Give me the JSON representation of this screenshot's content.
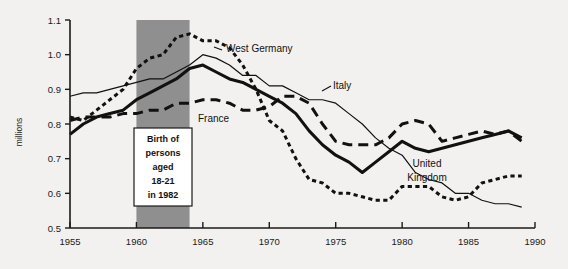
{
  "chart_data": {
    "type": "line",
    "title": "",
    "xlabel": "",
    "ylabel": "millions",
    "xlim": [
      1955,
      1990
    ],
    "ylim": [
      0.5,
      1.1
    ],
    "grid": false,
    "legend_position": "inline-annotations",
    "x_ticks": [
      "1955",
      "1960",
      "1965",
      "1970",
      "1975",
      "1980",
      "1985",
      "1990"
    ],
    "x_tick_values": [
      1955,
      1960,
      1965,
      1970,
      1975,
      1980,
      1985,
      1990
    ],
    "y_ticks": [
      "0.5",
      "0.6",
      "0.7",
      "0.8",
      "0.9",
      "1.0",
      "1.1"
    ],
    "y_tick_values": [
      0.5,
      0.6,
      0.7,
      0.8,
      0.9,
      1.0,
      1.1
    ],
    "x": [
      1955,
      1956,
      1957,
      1958,
      1959,
      1960,
      1961,
      1962,
      1963,
      1964,
      1965,
      1966,
      1967,
      1968,
      1969,
      1970,
      1971,
      1972,
      1973,
      1974,
      1975,
      1976,
      1977,
      1978,
      1979,
      1980,
      1981,
      1982,
      1983,
      1984,
      1985,
      1986,
      1987,
      1988,
      1989
    ],
    "series": [
      {
        "name": "West Germany",
        "line_style": "fine-dotted",
        "values": [
          0.82,
          0.81,
          0.84,
          0.87,
          0.9,
          0.96,
          0.99,
          1.0,
          1.05,
          1.06,
          1.04,
          1.04,
          1.02,
          0.97,
          0.9,
          0.81,
          0.78,
          0.7,
          0.64,
          0.63,
          0.6,
          0.6,
          0.59,
          0.58,
          0.58,
          0.62,
          0.62,
          0.62,
          0.59,
          0.58,
          0.59,
          0.63,
          0.64,
          0.65,
          0.65
        ]
      },
      {
        "name": "Italy",
        "line_style": "thin-solid",
        "values": [
          0.88,
          0.89,
          0.89,
          0.9,
          0.91,
          0.92,
          0.93,
          0.93,
          0.95,
          0.97,
          1.0,
          0.99,
          0.97,
          0.94,
          0.94,
          0.91,
          0.91,
          0.89,
          0.87,
          0.87,
          0.86,
          0.83,
          0.8,
          0.76,
          0.73,
          0.71,
          0.66,
          0.64,
          0.63,
          0.6,
          0.6,
          0.58,
          0.57,
          0.57,
          0.56
        ]
      },
      {
        "name": "France",
        "line_style": "long-dashed",
        "values": [
          0.81,
          0.82,
          0.82,
          0.82,
          0.83,
          0.83,
          0.84,
          0.84,
          0.86,
          0.86,
          0.87,
          0.87,
          0.86,
          0.84,
          0.84,
          0.85,
          0.88,
          0.88,
          0.86,
          0.8,
          0.75,
          0.74,
          0.74,
          0.74,
          0.76,
          0.8,
          0.81,
          0.8,
          0.75,
          0.76,
          0.77,
          0.78,
          0.77,
          0.78,
          0.75
        ]
      },
      {
        "name": "United Kingdom",
        "line_style": "thick-solid",
        "values": [
          0.77,
          0.8,
          0.82,
          0.83,
          0.84,
          0.87,
          0.89,
          0.91,
          0.93,
          0.96,
          0.97,
          0.95,
          0.93,
          0.92,
          0.9,
          0.88,
          0.86,
          0.83,
          0.78,
          0.74,
          0.71,
          0.69,
          0.66,
          0.69,
          0.72,
          0.75,
          0.73,
          0.72,
          0.73,
          0.74,
          0.75,
          0.76,
          0.77,
          0.78,
          0.76
        ]
      }
    ],
    "annotations": [
      {
        "name": "birth-cohort-band",
        "x_start": 1960,
        "x_end": 1964,
        "text_lines": [
          "Birth of",
          "persons",
          "aged",
          "18-21",
          "in 1982"
        ]
      }
    ]
  },
  "labels": {
    "west_germany": "West Germany",
    "italy": "Italy",
    "france": "France",
    "united_kingdom": "United Kingdom"
  },
  "axis": {
    "y_title": "millions"
  }
}
